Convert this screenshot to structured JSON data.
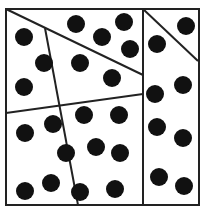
{
  "diagram": {
    "width": 208,
    "height": 219,
    "background": "#ffffff",
    "stroke_color": "#222222",
    "dot_color": "#111111",
    "dot_radius": 9,
    "outer_square": {
      "x1": 6,
      "y1": 9,
      "x2": 199,
      "y2": 205
    },
    "lines": [
      {
        "name": "vertical-divider",
        "x1": 143,
        "y1": 9,
        "x2": 143,
        "y2": 205
      },
      {
        "name": "top-right-diagonal",
        "x1": 143,
        "y1": 9,
        "x2": 198,
        "y2": 61
      },
      {
        "name": "top-left-diagonal",
        "x1": 6,
        "y1": 9,
        "x2": 143,
        "y2": 75
      },
      {
        "name": "slanted-divider",
        "x1": 45,
        "y1": 28,
        "x2": 78,
        "y2": 205
      },
      {
        "name": "middle-horizontal",
        "x1": 6,
        "y1": 113,
        "x2": 143,
        "y2": 94
      }
    ],
    "dots": [
      {
        "x": 24,
        "y": 37
      },
      {
        "x": 44,
        "y": 63
      },
      {
        "x": 24,
        "y": 87
      },
      {
        "x": 76,
        "y": 24
      },
      {
        "x": 102,
        "y": 37
      },
      {
        "x": 124,
        "y": 22
      },
      {
        "x": 130,
        "y": 49
      },
      {
        "x": 80,
        "y": 63
      },
      {
        "x": 112,
        "y": 78
      },
      {
        "x": 186,
        "y": 26
      },
      {
        "x": 157,
        "y": 44
      },
      {
        "x": 155,
        "y": 94
      },
      {
        "x": 183,
        "y": 85
      },
      {
        "x": 157,
        "y": 127
      },
      {
        "x": 183,
        "y": 138
      },
      {
        "x": 159,
        "y": 177
      },
      {
        "x": 184,
        "y": 186
      },
      {
        "x": 25,
        "y": 133
      },
      {
        "x": 53,
        "y": 124
      },
      {
        "x": 66,
        "y": 153
      },
      {
        "x": 25,
        "y": 191
      },
      {
        "x": 51,
        "y": 183
      },
      {
        "x": 80,
        "y": 192
      },
      {
        "x": 84,
        "y": 115
      },
      {
        "x": 119,
        "y": 115
      },
      {
        "x": 96,
        "y": 147
      },
      {
        "x": 120,
        "y": 153
      },
      {
        "x": 115,
        "y": 189
      }
    ]
  }
}
